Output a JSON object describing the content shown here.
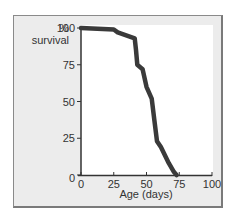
{
  "chart_data": {
    "type": "line",
    "title": "",
    "xlabel": "Age (days)",
    "ylabel": "% survival",
    "xlim": [
      0,
      100
    ],
    "ylim": [
      0,
      100
    ],
    "grid": false,
    "legend": null,
    "x_ticks": [
      "0",
      "25",
      "50",
      "75",
      "100"
    ],
    "y_ticks": [
      "0",
      "25",
      "50",
      "75",
      "100"
    ],
    "series": [
      {
        "name": "survival",
        "color": "#3a3a3a",
        "x": [
          0,
          25,
          28,
          41,
          42,
          43,
          47,
          50,
          54,
          56,
          58,
          61,
          67,
          71,
          73
        ],
        "y": [
          100,
          99,
          97,
          93,
          85,
          75,
          72,
          60,
          52,
          37,
          23,
          19,
          8,
          2,
          0
        ]
      }
    ]
  },
  "labels": {
    "y_percent": "%",
    "y_survival": "survival",
    "x_title": "Age (days)",
    "y_ticks": [
      "0",
      "25",
      "50",
      "75",
      "100"
    ],
    "x_ticks": [
      "0",
      "25",
      "50",
      "75",
      "100"
    ]
  }
}
